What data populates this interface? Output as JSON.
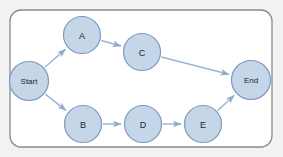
{
  "diagram": {
    "type": "directed-graph",
    "canvas": {
      "width": 283,
      "height": 157
    },
    "background_color": "#f2f2f2",
    "frame": {
      "x": 10,
      "y": 10,
      "width": 262,
      "height": 137,
      "corner_radius": 11,
      "fill": "#ffffff",
      "stroke": "#8c8c8c"
    },
    "style": {
      "node_fill": "#c6d6e9",
      "node_stroke": "#7d99bd",
      "node_text_color": "#1b2436",
      "edge_color": "#9bb6d4"
    },
    "nodes": [
      {
        "id": "start",
        "label": "Start",
        "cx": 29,
        "cy": 81,
        "r": 19.5,
        "size": "small-text"
      },
      {
        "id": "a",
        "label": "A",
        "cx": 82,
        "cy": 35,
        "r": 18.5,
        "size": "normal"
      },
      {
        "id": "c",
        "label": "C",
        "cx": 142,
        "cy": 52,
        "r": 18.5,
        "size": "normal"
      },
      {
        "id": "b",
        "label": "B",
        "cx": 83,
        "cy": 124,
        "r": 18.5,
        "size": "normal"
      },
      {
        "id": "d",
        "label": "D",
        "cx": 143,
        "cy": 124,
        "r": 18.5,
        "size": "normal"
      },
      {
        "id": "e",
        "label": "E",
        "cx": 203,
        "cy": 124,
        "r": 18.5,
        "size": "normal"
      },
      {
        "id": "end",
        "label": "End",
        "cx": 251,
        "cy": 80,
        "r": 19.5,
        "size": "small-text"
      }
    ],
    "edges": [
      {
        "id": "start-a",
        "from": "start",
        "to": "a",
        "label": ""
      },
      {
        "id": "start-b",
        "from": "start",
        "to": "b",
        "label": ""
      },
      {
        "id": "a-c",
        "from": "a",
        "to": "c",
        "label": ""
      },
      {
        "id": "c-end",
        "from": "c",
        "to": "end",
        "label": ""
      },
      {
        "id": "b-d",
        "from": "b",
        "to": "d",
        "label": ""
      },
      {
        "id": "d-e",
        "from": "d",
        "to": "e",
        "label": ""
      },
      {
        "id": "e-end",
        "from": "e",
        "to": "end",
        "label": ""
      }
    ]
  }
}
